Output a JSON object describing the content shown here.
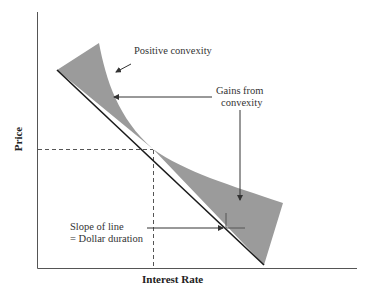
{
  "diagram": {
    "axes": {
      "x_label": "Interest Rate",
      "y_label": "Price"
    },
    "annotations": {
      "positive_convexity": "Positive convexity",
      "gains_line1": "Gains from",
      "gains_line2": "convexity",
      "slope_line1": "Slope of line",
      "slope_line2": "= Dollar duration"
    },
    "colors": {
      "axis": "#555555",
      "tangent_line": "#1a1a1a",
      "shaded_area": "#9b9b9b",
      "dashed_guides": "#555555",
      "arrows": "#333333"
    }
  }
}
